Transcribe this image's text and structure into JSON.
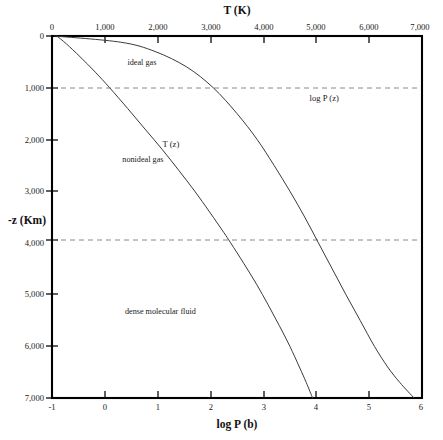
{
  "chart_data": {
    "type": "line",
    "title": "",
    "xlabel": "log P (b)",
    "xlabel_top": "T (K)",
    "ylabel": "-z (Km)",
    "xlim": [
      -1,
      6
    ],
    "xlim_top": [
      0,
      7000
    ],
    "ylim": [
      0,
      7000
    ],
    "y_inverted": true,
    "grid": "horizontal dashed at -z = 1,000 and 4,000",
    "legend": "none (curves labelled inline)",
    "x_ticks": [
      -1,
      0,
      1,
      2,
      3,
      4,
      5,
      6
    ],
    "x_tick_labels": [
      "-1",
      "0",
      "1",
      "2",
      "3",
      "4",
      "5",
      "6"
    ],
    "x_top_ticks": [
      0,
      1000,
      2000,
      3000,
      4000,
      5000,
      6000,
      7000
    ],
    "x_top_tick_labels": [
      "0",
      "1,000",
      "2,000",
      "3,000",
      "4,000",
      "5,000",
      "6,000",
      "7,000"
    ],
    "y_ticks": [
      0,
      1000,
      2000,
      3000,
      4000,
      5000,
      6000,
      7000
    ],
    "y_tick_labels": [
      "0",
      "1,000",
      "2,000",
      "3,000",
      "4,000",
      "5,000",
      "6,000",
      "7,000"
    ],
    "gridline_values": [
      1000,
      4000
    ],
    "series": [
      {
        "name": "T (z)",
        "label": "T (z)",
        "axis": "top (T in K)",
        "color": "#3a3a3a",
        "label_position": {
          "x_T": 2250,
          "depth": 2150
        },
        "points": [
          {
            "depth": 0,
            "T": 90
          },
          {
            "depth": 150,
            "T": 270
          },
          {
            "depth": 400,
            "T": 530
          },
          {
            "depth": 700,
            "T": 820
          },
          {
            "depth": 1000,
            "T": 1090
          },
          {
            "depth": 1400,
            "T": 1430
          },
          {
            "depth": 1800,
            "T": 1760
          },
          {
            "depth": 2200,
            "T": 2090
          },
          {
            "depth": 2600,
            "T": 2400
          },
          {
            "depth": 3000,
            "T": 2700
          },
          {
            "depth": 3400,
            "T": 2980
          },
          {
            "depth": 3800,
            "T": 3250
          },
          {
            "depth": 4000,
            "T": 3380
          },
          {
            "depth": 4400,
            "T": 3630
          },
          {
            "depth": 4800,
            "T": 3870
          },
          {
            "depth": 5200,
            "T": 4090
          },
          {
            "depth": 5600,
            "T": 4300
          },
          {
            "depth": 6000,
            "T": 4500
          },
          {
            "depth": 6400,
            "T": 4680
          },
          {
            "depth": 6700,
            "T": 4810
          },
          {
            "depth": 7000,
            "T": 4930
          }
        ]
      },
      {
        "name": "log P (z)",
        "label": "log P (z)",
        "axis": "bottom (log P in bar)",
        "color": "#3a3a3a",
        "label_position": {
          "logP": 4.15,
          "depth": 1250
        },
        "points": [
          {
            "depth": 0,
            "logP": -0.95
          },
          {
            "depth": 120,
            "logP": 0.3
          },
          {
            "depth": 300,
            "logP": 0.95
          },
          {
            "depth": 600,
            "logP": 1.55
          },
          {
            "depth": 1000,
            "logP": 2.05
          },
          {
            "depth": 1500,
            "logP": 2.5
          },
          {
            "depth": 2000,
            "logP": 2.88
          },
          {
            "depth": 2500,
            "logP": 3.2
          },
          {
            "depth": 3000,
            "logP": 3.5
          },
          {
            "depth": 3500,
            "logP": 3.78
          },
          {
            "depth": 4000,
            "logP": 4.04
          },
          {
            "depth": 4500,
            "logP": 4.3
          },
          {
            "depth": 5000,
            "logP": 4.56
          },
          {
            "depth": 5500,
            "logP": 4.83
          },
          {
            "depth": 6000,
            "logP": 5.1
          },
          {
            "depth": 6400,
            "logP": 5.35
          },
          {
            "depth": 6700,
            "logP": 5.58
          },
          {
            "depth": 7000,
            "logP": 5.85
          }
        ]
      }
    ],
    "annotations": [
      {
        "text": "ideal gas",
        "x_logP": 0.7,
        "depth": 560
      },
      {
        "text": "nonideal gas",
        "x_logP": 0.72,
        "depth": 2430
      },
      {
        "text": "dense molecular fluid",
        "x_logP": 1.05,
        "depth": 5380
      }
    ]
  }
}
